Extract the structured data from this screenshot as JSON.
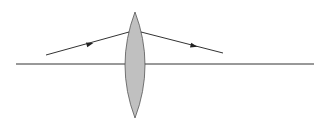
{
  "diagram": {
    "type": "optics-ray-diagram",
    "colors": {
      "background": "#ffffff",
      "line": "#333333",
      "lens_fill": "#c0c0c0",
      "lens_stroke": "#555555"
    },
    "optical_axis": {
      "x1": 16,
      "y1": 64,
      "x2": 314,
      "y2": 64
    },
    "lens": {
      "cx": 135,
      "top": 12,
      "bottom": 118,
      "half_width": 10
    },
    "rays": [
      {
        "name": "incident-ray",
        "x1": 46,
        "y1": 55,
        "x2": 129,
        "y2": 32,
        "arrow_at": [
          90,
          44
        ]
      },
      {
        "name": "refracted-ray",
        "x1": 141,
        "y1": 32,
        "x2": 223,
        "y2": 53,
        "arrow_at": [
          194,
          46
        ]
      }
    ]
  }
}
